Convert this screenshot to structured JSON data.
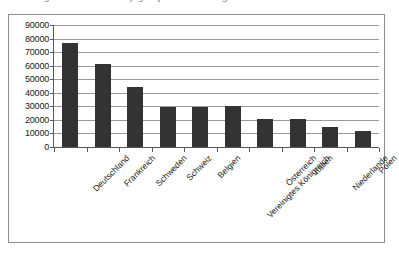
{
  "caption": {
    "text": "Abbildung: Anzahl der Beschäftigten pro Land im Vergleich"
  },
  "colors": {
    "bar": "#333333",
    "grid": "#9a9a9a",
    "axis": "#595959",
    "frame": "#8c8c8c",
    "background": "#ffffff",
    "text": "#1a1a1a"
  },
  "chart_data": {
    "type": "bar",
    "title": "",
    "xlabel": "",
    "ylabel": "",
    "categories": [
      "Deutschland",
      "Frankreich",
      "Schweden",
      "Schweiz",
      "Belgien",
      "Vereinigtes Königreich",
      "Österreich",
      "Italien",
      "Niederlande",
      "Polen"
    ],
    "values": [
      77000,
      61000,
      44000,
      29500,
      29500,
      30000,
      20500,
      20500,
      14500,
      11500
    ],
    "ylim": [
      0,
      90000
    ],
    "ytick_step": 10000,
    "yticks": [
      0,
      10000,
      20000,
      30000,
      40000,
      50000,
      60000,
      70000,
      80000,
      90000
    ],
    "ytick_labels": [
      "0",
      "10000",
      "20000",
      "30000",
      "40000",
      "50000",
      "60000",
      "70000",
      "80000",
      "90000"
    ],
    "grid": true,
    "grid_axis": "y",
    "legend": false,
    "legend_position": "none",
    "label_rotation": -45,
    "series": [
      {
        "name": "Anzahl",
        "values": [
          77000,
          61000,
          44000,
          29500,
          29500,
          30000,
          20500,
          20500,
          14500,
          11500
        ]
      }
    ]
  }
}
